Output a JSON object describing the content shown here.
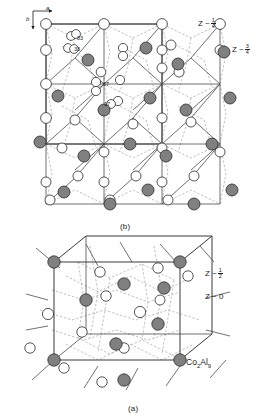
{
  "figure": {
    "compound_plain": "Co2Al9",
    "panels": [
      {
        "id": "b",
        "caption": "(b)",
        "description": "Extended projection of the Co2Al9 structure along c showing several unit cells",
        "axes": [
          {
            "name": "a",
            "direction": "right"
          },
          {
            "name": "b",
            "direction": "down"
          }
        ],
        "z_labels": [
          {
            "text": "Z ~",
            "numerator": "1",
            "denominator": "4"
          },
          {
            "text": "Z ~",
            "numerator": "3",
            "denominator": "4"
          }
        ],
        "site_labels": [
          "83",
          "33",
          "67",
          "17"
        ]
      },
      {
        "id": "a",
        "caption": "(a)",
        "description": "Single unit cell of Co2Al9 with bonds drawn as dashed lines",
        "z_labels": [
          {
            "text": "Z ~",
            "numerator": "1",
            "denominator": "2"
          },
          {
            "text": "Z ~ 0"
          }
        ],
        "formula": {
          "element1": "Co",
          "sub1": "2",
          "element2": "Al",
          "sub2": "9"
        }
      }
    ]
  },
  "captions": {
    "panel_b": "(b)",
    "panel_a": "(a)"
  },
  "axes": {
    "a_label": "a",
    "b_label": "b"
  },
  "site_labels": {
    "s83": "83",
    "s33": "33",
    "s67": "67",
    "s17": "17"
  },
  "z_top": {
    "quarter_prefix": "Z ~",
    "quarter_num": "1",
    "quarter_den": "4",
    "threequarter_prefix": "Z ~",
    "threequarter_num": "3",
    "threequarter_den": "4"
  },
  "z_bottom": {
    "half_prefix": "Z ~",
    "half_num": "1",
    "half_den": "2",
    "zero_text": "Z ~ 0"
  },
  "formula": {
    "co": "Co",
    "co_sub": "2",
    "al": "Al",
    "al_sub": "9"
  },
  "colors": {
    "cobalt_fill": "#808080",
    "aluminium_fill": "#ffffff",
    "outline": "#1a1a1a",
    "bond_solid": "#555555",
    "bond_dashed": "#999999",
    "background": "#ffffff"
  },
  "legend_meaning": {
    "filled_circle": "Co atom (shaded)",
    "open_circle": "Al atom (open)"
  }
}
